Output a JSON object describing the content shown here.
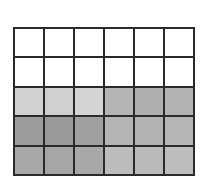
{
  "grid": {
    "rows": 5,
    "cols": 6,
    "line_color": "#2a2a2a",
    "cells": [
      [
        "#ffffff",
        "#ffffff",
        "#ffffff",
        "#ffffff",
        "#ffffff",
        "#ffffff"
      ],
      [
        "#ffffff",
        "#ffffff",
        "#ffffff",
        "#ffffff",
        "#ffffff",
        "#ffffff"
      ],
      [
        "#d2d2d2",
        "#d0d0d0",
        "#d4d4d4",
        "#b4b4b4",
        "#b0b0b0",
        "#b2b2b2"
      ],
      [
        "#9c9c9c",
        "#9a9a9a",
        "#a0a0a0",
        "#b4b4b4",
        "#b2b2b2",
        "#b6b6b6"
      ],
      [
        "#a8a8a8",
        "#a6a6a6",
        "#a8a8a8",
        "#bcbcbc",
        "#bababa",
        "#bebebe"
      ]
    ]
  }
}
